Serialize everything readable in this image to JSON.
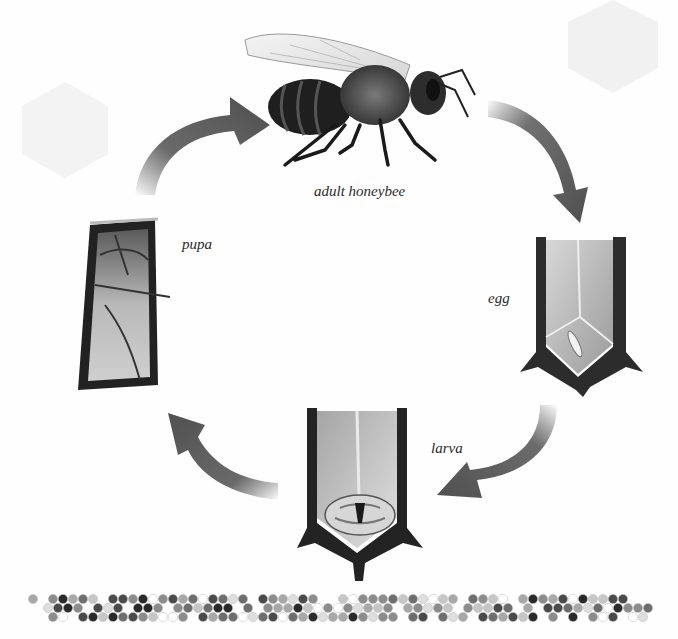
{
  "stages": {
    "adult": {
      "label": "adult honeybee"
    },
    "egg": {
      "label": "egg"
    },
    "larva": {
      "label": "larva"
    },
    "pupa": {
      "label": "pupa"
    }
  },
  "cycle_order": [
    "egg",
    "larva",
    "pupa",
    "adult honeybee"
  ],
  "colors": {
    "arrow": "#555555",
    "cell_wall": "#2b2b2b",
    "cell_inner": "#b8b8b8",
    "background": "#fefefe"
  },
  "honeycomb_strip": {
    "rows": 3,
    "cells_per_row": 62
  }
}
